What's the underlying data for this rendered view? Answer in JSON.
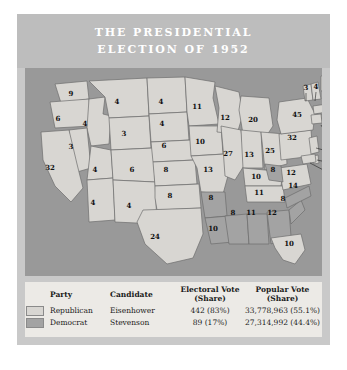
{
  "figure": {
    "title_lines": [
      "THE PRESIDENTIAL",
      "ELECTION OF 1952"
    ],
    "colors": {
      "band": "#bdbdbd",
      "figure_bg": "#c9c9c9",
      "map_water": "#999999",
      "republican": "#d8d6d2",
      "democrat": "#a3a3a3",
      "legend_bg": "#eceae6",
      "text": "#1a1a1a"
    }
  },
  "legend": {
    "headers": [
      "",
      "Party",
      "Candidate",
      "Electoral Vote (Share)",
      "Popular Vote (Share)"
    ],
    "header_electoral_l1": "Electoral Vote",
    "header_electoral_l2": "(Share)",
    "header_popular_l1": "Popular Vote",
    "header_popular_l2": "(Share)",
    "header_party": "Party",
    "header_candidate": "Candidate",
    "rows": [
      {
        "swatch": "republican",
        "party": "Republican",
        "candidate": "Eisenhower",
        "electoral": "442 (83%)",
        "popular": "33,778,963 (55.1%)"
      },
      {
        "swatch": "democrat",
        "party": "Democrat",
        "candidate": "Stevenson",
        "electoral": "89 (17%)",
        "popular": "27,314,992 (44.4%)"
      }
    ]
  },
  "chart_data": {
    "type": "map",
    "title": "THE PRESIDENTIAL ELECTION OF 1952",
    "legend_position": "bottom",
    "series": [
      {
        "name": "Republican",
        "candidate": "Eisenhower",
        "electoral_votes": 442,
        "electoral_share": "83%",
        "popular_votes": 33778963,
        "popular_share": "55.1%",
        "color": "#d8d6d2"
      },
      {
        "name": "Democrat",
        "candidate": "Stevenson",
        "electoral_votes": 89,
        "electoral_share": "17%",
        "popular_votes": 27314992,
        "popular_share": "44.4%",
        "color": "#a3a3a3"
      }
    ],
    "states": [
      {
        "code": "WA",
        "value": 9,
        "party": "Republican",
        "x": 46,
        "y": 28
      },
      {
        "code": "OR",
        "value": 6,
        "party": "Republican",
        "x": 33,
        "y": 53
      },
      {
        "code": "ID",
        "value": 4,
        "party": "Republican",
        "x": 60,
        "y": 58
      },
      {
        "code": "MT",
        "value": 4,
        "party": "Republican",
        "x": 92,
        "y": 36
      },
      {
        "code": "WY",
        "value": 3,
        "party": "Republican",
        "x": 99,
        "y": 68
      },
      {
        "code": "NV",
        "value": 3,
        "party": "Republican",
        "x": 46,
        "y": 81
      },
      {
        "code": "CA",
        "value": 32,
        "party": "Republican",
        "x": 25,
        "y": 102
      },
      {
        "code": "UT",
        "value": 4,
        "party": "Republican",
        "x": 70,
        "y": 104
      },
      {
        "code": "AZ",
        "value": 4,
        "party": "Republican",
        "x": 68,
        "y": 137
      },
      {
        "code": "CO",
        "value": 6,
        "party": "Republican",
        "x": 107,
        "y": 104
      },
      {
        "code": "NM",
        "value": 4,
        "party": "Republican",
        "x": 104,
        "y": 140
      },
      {
        "code": "ND",
        "value": 4,
        "party": "Republican",
        "x": 136,
        "y": 36
      },
      {
        "code": "SD",
        "value": 4,
        "party": "Republican",
        "x": 137,
        "y": 58
      },
      {
        "code": "NE",
        "value": 6,
        "party": "Republican",
        "x": 139,
        "y": 80
      },
      {
        "code": "KS",
        "value": 8,
        "party": "Republican",
        "x": 141,
        "y": 104
      },
      {
        "code": "OK",
        "value": 8,
        "party": "Republican",
        "x": 145,
        "y": 130
      },
      {
        "code": "TX",
        "value": 24,
        "party": "Republican",
        "x": 130,
        "y": 171
      },
      {
        "code": "MN",
        "value": 11,
        "party": "Republican",
        "x": 172,
        "y": 41
      },
      {
        "code": "IA",
        "value": 10,
        "party": "Republican",
        "x": 175,
        "y": 76
      },
      {
        "code": "MO",
        "value": 13,
        "party": "Republican",
        "x": 183,
        "y": 104
      },
      {
        "code": "AR",
        "value": 8,
        "party": "Democrat",
        "x": 186,
        "y": 132
      },
      {
        "code": "LA",
        "value": 10,
        "party": "Democrat",
        "x": 188,
        "y": 163
      },
      {
        "code": "WI",
        "value": 12,
        "party": "Republican",
        "x": 200,
        "y": 52
      },
      {
        "code": "IL",
        "value": 27,
        "party": "Republican",
        "x": 203,
        "y": 88
      },
      {
        "code": "MI",
        "value": 20,
        "party": "Republican",
        "x": 228,
        "y": 54
      },
      {
        "code": "IN",
        "value": 13,
        "party": "Republican",
        "x": 224,
        "y": 89
      },
      {
        "code": "OH",
        "value": 25,
        "party": "Republican",
        "x": 245,
        "y": 85
      },
      {
        "code": "KY",
        "value": 10,
        "party": "Republican",
        "x": 231,
        "y": 111
      },
      {
        "code": "TN",
        "value": 11,
        "party": "Republican",
        "x": 234,
        "y": 127
      },
      {
        "code": "MS",
        "value": 8,
        "party": "Democrat",
        "x": 208,
        "y": 147
      },
      {
        "code": "AL",
        "value": 11,
        "party": "Democrat",
        "x": 226,
        "y": 147
      },
      {
        "code": "GA",
        "value": 12,
        "party": "Democrat",
        "x": 247,
        "y": 147
      },
      {
        "code": "FL",
        "value": 10,
        "party": "Republican",
        "x": 264,
        "y": 178
      },
      {
        "code": "SC",
        "value": 8,
        "party": "Democrat",
        "x": 258,
        "y": 133
      },
      {
        "code": "NC",
        "value": 14,
        "party": "Democrat",
        "x": 268,
        "y": 120
      },
      {
        "code": "VA",
        "value": 12,
        "party": "Republican",
        "x": 266,
        "y": 107
      },
      {
        "code": "WV",
        "value": 8,
        "party": "Democrat",
        "x": 248,
        "y": 104
      },
      {
        "code": "PA",
        "value": 32,
        "party": "Republican",
        "x": 267,
        "y": 72
      },
      {
        "code": "NY",
        "value": 45,
        "party": "Republican",
        "x": 272,
        "y": 49
      },
      {
        "code": "VT",
        "value": 3,
        "party": "Republican",
        "x": 281,
        "y": 22
      },
      {
        "code": "NH",
        "value": 4,
        "party": "Republican",
        "x": 291,
        "y": 21
      },
      {
        "code": "ME",
        "value": 5,
        "party": "Republican",
        "x": 306,
        "y": 26
      },
      {
        "code": "MA",
        "value": 16,
        "party": "Republican",
        "x": 312,
        "y": 49
      },
      {
        "code": "RI",
        "value": 4,
        "party": "Republican",
        "x": 312,
        "y": 62
      },
      {
        "code": "CT",
        "value": 8,
        "party": "Republican",
        "x": 312,
        "y": 73
      },
      {
        "code": "NJ",
        "value": 16,
        "party": "Republican",
        "x": 312,
        "y": 84
      },
      {
        "code": "DE",
        "value": 3,
        "party": "Republican",
        "x": 312,
        "y": 95
      },
      {
        "code": "MD",
        "value": 9,
        "party": "Republican",
        "x": 312,
        "y": 106
      }
    ]
  }
}
